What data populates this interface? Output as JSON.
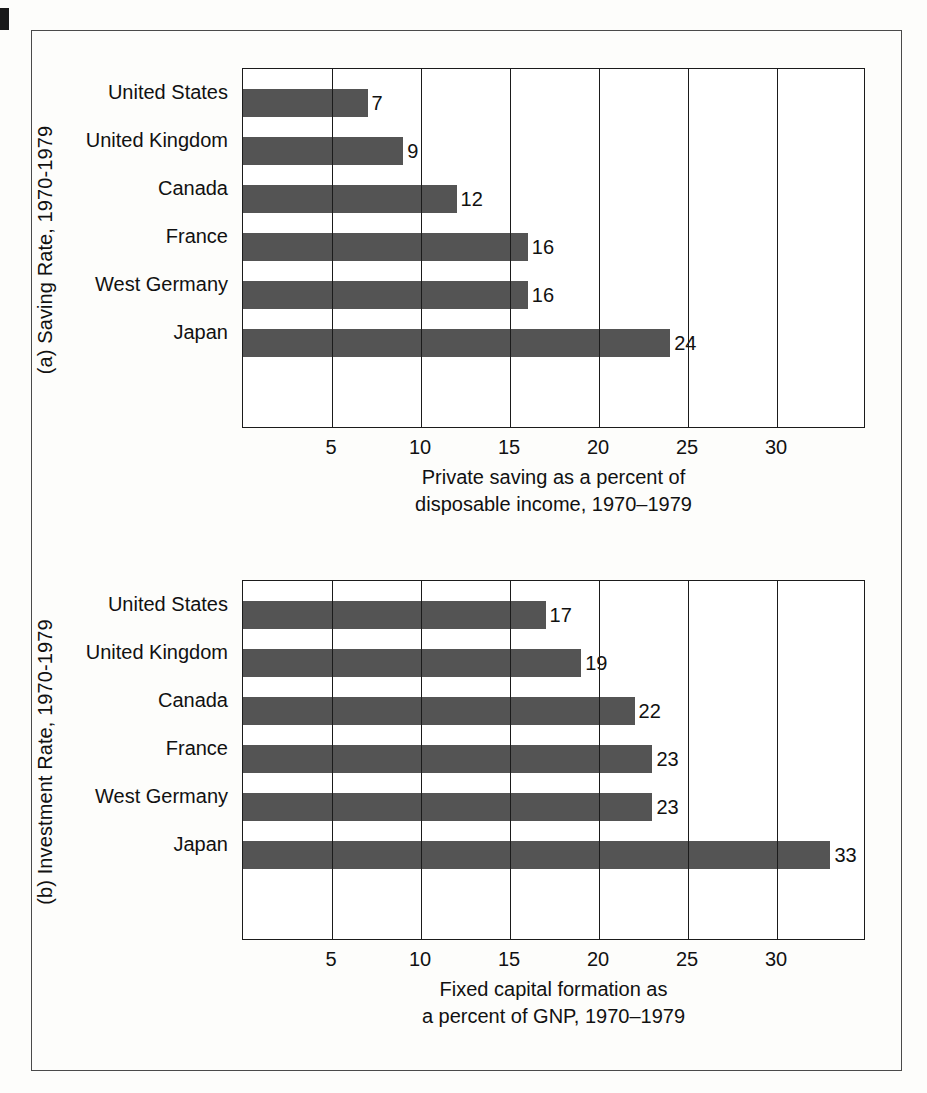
{
  "figure": {
    "background_color": "#fdfdfb",
    "frame_color": "#4a4a4a",
    "bar_color": "#545454",
    "axis_color": "#1b1b1b"
  },
  "chart_data": [
    {
      "type": "bar",
      "orientation": "horizontal",
      "panel_id": "(a)",
      "side_title": "(a)  Saving Rate, 1970-1979",
      "title": "",
      "categories": [
        "United States",
        "United Kingdom",
        "Canada",
        "France",
        "West Germany",
        "Japan"
      ],
      "values": [
        7,
        9,
        12,
        16,
        16,
        24
      ],
      "value_labels": [
        "7",
        "9",
        "12",
        "16",
        "16",
        "24"
      ],
      "xlabel_line1": "Private saving as a percent of",
      "xlabel_line2": "disposable income, 1970–1979",
      "ylabel": "",
      "xlim": [
        0,
        35
      ],
      "xticks": [
        5,
        10,
        15,
        20,
        25,
        30
      ],
      "xtick_labels": [
        "5",
        "10",
        "15",
        "20",
        "25",
        "30"
      ],
      "grid": true,
      "legend": "none"
    },
    {
      "type": "bar",
      "orientation": "horizontal",
      "panel_id": "(b)",
      "side_title": "(b)  Investment Rate, 1970-1979",
      "title": "",
      "categories": [
        "United States",
        "United Kingdom",
        "Canada",
        "France",
        "West Germany",
        "Japan"
      ],
      "values": [
        17,
        19,
        22,
        23,
        23,
        33
      ],
      "value_labels": [
        "17",
        "19",
        "22",
        "23",
        "23",
        "33"
      ],
      "xlabel_line1": "Fixed capital formation as",
      "xlabel_line2": "a percent of GNP, 1970–1979",
      "ylabel": "",
      "xlim": [
        0,
        35
      ],
      "xticks": [
        5,
        10,
        15,
        20,
        25,
        30
      ],
      "xtick_labels": [
        "5",
        "10",
        "15",
        "20",
        "25",
        "30"
      ],
      "grid": true,
      "legend": "none"
    }
  ]
}
